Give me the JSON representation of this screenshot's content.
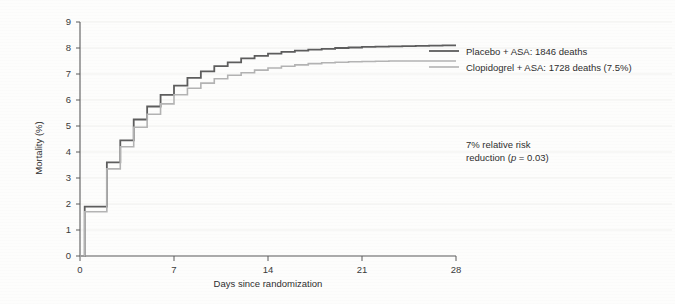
{
  "chart_data": {
    "type": "line",
    "subtype": "kaplan-meier-step",
    "title": "",
    "xlabel": "Days since randomization",
    "ylabel": "Mortality (%)",
    "xlim": [
      0,
      28
    ],
    "ylim": [
      0,
      9
    ],
    "xticks": [
      0,
      7,
      14,
      21,
      28
    ],
    "xticklabels": [
      "0",
      "7",
      "14",
      "21",
      "28"
    ],
    "yticks": [
      0,
      1,
      2,
      3,
      4,
      5,
      6,
      7,
      8,
      9
    ],
    "yticklabels": [
      "0",
      "1",
      "2",
      "3",
      "4",
      "5",
      "6",
      "7",
      "8",
      "9"
    ],
    "grid": "faint-horizontal",
    "legend_position": "top-right",
    "series": [
      {
        "name": "Placebo + ASA: 1846 deaths",
        "color": "#5d5d5d",
        "linewidth": 1.8,
        "x": [
          0,
          0.35,
          1,
          2,
          3,
          4,
          5,
          6,
          7,
          8,
          9,
          10,
          11,
          12,
          13,
          14,
          15,
          16,
          17,
          18,
          19,
          20,
          21,
          22,
          23,
          24,
          25,
          26,
          27,
          28
        ],
        "y": [
          0,
          1.9,
          1.9,
          3.6,
          4.45,
          5.25,
          5.75,
          6.2,
          6.55,
          6.85,
          7.1,
          7.3,
          7.45,
          7.6,
          7.7,
          7.78,
          7.85,
          7.9,
          7.94,
          7.97,
          8.0,
          8.02,
          8.04,
          8.05,
          8.06,
          8.07,
          8.08,
          8.09,
          8.1,
          8.1
        ]
      },
      {
        "name": "Clopidogrel + ASA: 1728 deaths (7.5%)",
        "color": "#b3b3b3",
        "linewidth": 1.6,
        "x": [
          0,
          0.35,
          1,
          2,
          3,
          4,
          5,
          6,
          7,
          8,
          9,
          10,
          11,
          12,
          13,
          14,
          15,
          16,
          17,
          18,
          19,
          20,
          21,
          22,
          23,
          24,
          25,
          26,
          27,
          28
        ],
        "y": [
          0,
          1.7,
          1.7,
          3.35,
          4.2,
          4.95,
          5.45,
          5.85,
          6.2,
          6.45,
          6.65,
          6.82,
          6.95,
          7.05,
          7.15,
          7.23,
          7.3,
          7.35,
          7.4,
          7.43,
          7.45,
          7.47,
          7.48,
          7.49,
          7.5,
          7.5,
          7.5,
          7.5,
          7.5,
          7.5
        ]
      }
    ],
    "annotations": [
      {
        "name": "relative-risk-note",
        "line1": "7% relative risk",
        "line2_pre": "reduction (",
        "line2_italic": "p",
        "line2_post": " = 0.03)"
      }
    ]
  },
  "legend": {
    "items": [
      {
        "label": "Placebo + ASA: 1846 deaths",
        "color": "#5d5d5d"
      },
      {
        "label": "Clopidogrel + ASA: 1728 deaths (7.5%)",
        "color": "#b3b3b3"
      }
    ]
  }
}
